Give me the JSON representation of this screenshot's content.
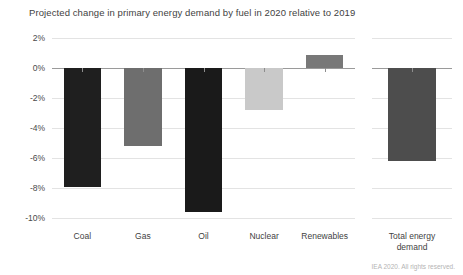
{
  "chart_data": {
    "type": "bar",
    "title": "Projected change in primary energy demand by fuel in 2020 relative to 2019",
    "xlabel": "",
    "ylabel": "",
    "ylim": [
      -10,
      2
    ],
    "yticks": [
      2,
      0,
      -2,
      -4,
      -6,
      -8,
      -10
    ],
    "ytick_labels": [
      "2%",
      "0%",
      "-2%",
      "-4%",
      "-6%",
      "-8%",
      "-10%"
    ],
    "grid": true,
    "legend": "none",
    "unit": "%",
    "categories": [
      "Coal",
      "Gas",
      "Oil",
      "Nuclear",
      "Renewables",
      "Total energy\ndemand"
    ],
    "values": [
      -7.9,
      -5.2,
      -9.6,
      -2.8,
      0.9,
      -6.2
    ],
    "bar_colors": [
      "#1f1f1f",
      "#6e6e6e",
      "#1a1a1a",
      "#c9c9c9",
      "#787878",
      "#4d4d4d"
    ],
    "panels": [
      {
        "name": "fuels",
        "categories": [
          "Coal",
          "Gas",
          "Oil",
          "Nuclear",
          "Renewables"
        ]
      },
      {
        "name": "total",
        "categories": [
          "Total energy\ndemand"
        ]
      }
    ]
  },
  "footer": {
    "credit": "IEA 2020. All rights reserved."
  },
  "colors": {
    "background": "#ffffff",
    "grid": "#e3e3e3",
    "zero_line": "#9a9a9a",
    "text": "#3f3f3f",
    "credit_text": "#b4b4b4"
  }
}
